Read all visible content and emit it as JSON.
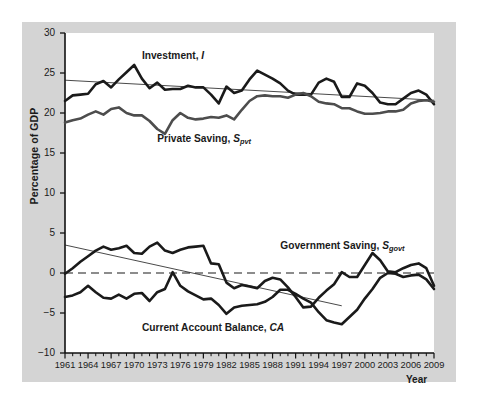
{
  "chart_data": {
    "type": "line",
    "title": "",
    "xlabel": "Year",
    "ylabel": "Percentage of GDP",
    "xlim": [
      1961,
      2009
    ],
    "ylim": [
      -10,
      30
    ],
    "grid": false,
    "legend_position": "inline-annotations",
    "y_ticks": [
      "30",
      "25",
      "20",
      "15",
      "10",
      "5",
      "0",
      "-5",
      "-10"
    ],
    "y_tick_values": [
      30,
      25,
      20,
      15,
      10,
      5,
      0,
      -5,
      -10
    ],
    "x_ticks": [
      "1961",
      "1964",
      "1967",
      "1970",
      "1973",
      "1976",
      "1979",
      "1982",
      "1985",
      "1988",
      "1991",
      "1994",
      "1997",
      "2000",
      "2003",
      "2006",
      "2009"
    ],
    "x_tick_values": [
      1961,
      1964,
      1967,
      1970,
      1973,
      1976,
      1979,
      1982,
      1985,
      1988,
      1991,
      1994,
      1997,
      2000,
      2003,
      2006,
      2009
    ],
    "x_minor_interval": 1,
    "zero_line": 0,
    "zero_line_style": "dashed",
    "annotations": [
      {
        "text": "Investment, I",
        "symbol": "I",
        "x": 1971,
        "y": 27.0
      },
      {
        "text": "Private Saving, S_pvt",
        "symbol": "S",
        "sub": "pvt",
        "x": 1973,
        "y": 16.6
      },
      {
        "text": "Government Saving, S_govt",
        "symbol": "S",
        "sub": "govt",
        "x": 1989,
        "y": 3.2
      },
      {
        "text": "Current Account Balance, CA",
        "symbol": "CA",
        "x": 1971,
        "y": -7.0
      }
    ],
    "years": [
      1961,
      1962,
      1963,
      1964,
      1965,
      1966,
      1967,
      1968,
      1969,
      1970,
      1971,
      1972,
      1973,
      1974,
      1975,
      1976,
      1977,
      1978,
      1979,
      1980,
      1981,
      1982,
      1983,
      1984,
      1985,
      1986,
      1987,
      1988,
      1989,
      1990,
      1991,
      1992,
      1993,
      1994,
      1995,
      1996,
      1997,
      1998,
      1999,
      2000,
      2001,
      2002,
      2003,
      2004,
      2005,
      2006,
      2007,
      2008,
      2009
    ],
    "series": [
      {
        "name": "Investment, I",
        "color": "#1a1a1a",
        "width": 2.6,
        "values": [
          21.5,
          22.2,
          22.3,
          22.4,
          23.6,
          24.0,
          23.2,
          24.2,
          25.1,
          26.0,
          24.3,
          23.1,
          23.8,
          22.9,
          23.0,
          23.0,
          23.4,
          23.2,
          23.2,
          22.3,
          21.2,
          23.3,
          22.5,
          22.8,
          24.2,
          25.3,
          24.8,
          24.3,
          23.7,
          22.8,
          22.3,
          22.3,
          22.3,
          23.8,
          24.3,
          23.9,
          22.0,
          22.0,
          23.7,
          23.4,
          22.5,
          21.3,
          21.1,
          21.1,
          21.8,
          22.5,
          22.8,
          22.3,
          21.1
        ]
      },
      {
        "name": "Private Saving, S_pvt",
        "color": "#4d4d4d",
        "width": 2.6,
        "values": [
          18.8,
          19.1,
          19.3,
          19.8,
          20.2,
          19.8,
          20.5,
          20.7,
          20.0,
          19.7,
          19.7,
          19.0,
          18.0,
          17.4,
          19.1,
          20.0,
          19.4,
          19.2,
          19.3,
          19.5,
          19.4,
          19.7,
          19.2,
          20.4,
          21.5,
          22.1,
          22.2,
          22.1,
          22.1,
          21.9,
          22.3,
          22.5,
          22.1,
          21.4,
          21.2,
          21.1,
          20.6,
          20.6,
          20.2,
          19.9,
          19.9,
          20.0,
          20.2,
          20.2,
          20.4,
          21.2,
          21.5,
          21.6,
          21.4
        ]
      },
      {
        "name": "Government Saving, S_govt",
        "color": "#1a1a1a",
        "width": 2.6,
        "values": [
          -0.1,
          0.6,
          1.4,
          2.1,
          2.8,
          3.3,
          2.9,
          3.1,
          3.4,
          2.5,
          2.4,
          3.3,
          3.8,
          2.8,
          2.5,
          2.9,
          3.2,
          3.3,
          3.4,
          1.2,
          1.1,
          -1.2,
          -1.9,
          -1.5,
          -1.7,
          -1.9,
          -1.0,
          -0.6,
          -0.8,
          -1.8,
          -3.0,
          -4.3,
          -4.2,
          -3.1,
          -2.2,
          -1.4,
          0.1,
          -0.5,
          -0.5,
          1.0,
          2.5,
          1.6,
          0.2,
          0.1,
          0.6,
          1.0,
          1.2,
          0.6,
          -1.6,
          -4.2
        ]
      },
      {
        "name": "Current Account Balance, CA",
        "color": "#1a1a1a",
        "width": 2.6,
        "values": [
          -3.0,
          -2.8,
          -2.4,
          -1.6,
          -2.4,
          -3.1,
          -3.2,
          -2.7,
          -3.2,
          -2.6,
          -2.5,
          -3.5,
          -2.4,
          -2.0,
          0.1,
          -1.6,
          -2.3,
          -2.8,
          -3.3,
          -3.2,
          -4.0,
          -5.1,
          -4.3,
          -4.1,
          -4.0,
          -3.9,
          -3.6,
          -3.0,
          -2.1,
          -2.1,
          -2.6,
          -3.2,
          -3.7,
          -4.9,
          -5.9,
          -6.2,
          -6.4,
          -5.5,
          -4.6,
          -3.2,
          -2.0,
          -0.6,
          0.0,
          -0.1,
          -0.5,
          -0.3,
          -0.2,
          -0.8,
          -2.0
        ]
      }
    ],
    "trendlines": [
      {
        "for": "Investment, I",
        "x0": 1961,
        "y0": 24.1,
        "x1": 2009,
        "y1": 21.6,
        "color": "#1a1a1a",
        "width": 0.8
      },
      {
        "for": "Government Saving, S_govt",
        "x0": 1961,
        "y0": 3.5,
        "x1": 1997,
        "y1": -4.1,
        "color": "#1a1a1a",
        "width": 0.8
      }
    ]
  },
  "axis": {
    "y_title": "Percentage of GDP",
    "x_title": "Year"
  }
}
